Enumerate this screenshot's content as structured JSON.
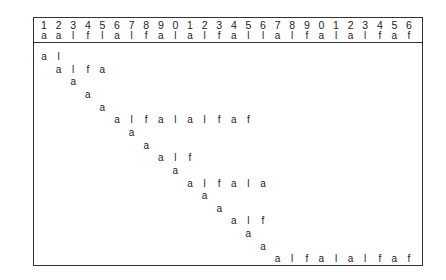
{
  "header": {
    "numbers": [
      "1",
      "2",
      "3",
      "4",
      "5",
      "6",
      "7",
      "8",
      "9",
      "0",
      "1",
      "2",
      "3",
      "4",
      "5",
      "6",
      "7",
      "8",
      "9",
      "0",
      "1",
      "2",
      "3",
      "4",
      "5",
      "6"
    ],
    "letters": [
      "a",
      "a",
      "l",
      "f",
      "l",
      "a",
      "l",
      "f",
      "a",
      "l",
      "a",
      "l",
      "f",
      "a",
      "l",
      "l",
      "a",
      "l",
      "f",
      "a",
      "l",
      "a",
      "l",
      "f",
      "a",
      "f"
    ]
  },
  "rows": [
    {
      "start": 1,
      "chars": [
        "a",
        "l"
      ]
    },
    {
      "start": 2,
      "chars": [
        "a",
        "l",
        "f",
        "a"
      ]
    },
    {
      "start": 3,
      "chars": [
        "a"
      ]
    },
    {
      "start": 4,
      "chars": [
        "a"
      ]
    },
    {
      "start": 5,
      "chars": [
        "a"
      ]
    },
    {
      "start": 6,
      "chars": [
        "a",
        "l",
        "f",
        "a",
        "l",
        "a",
        "l",
        "f",
        "a",
        "f"
      ]
    },
    {
      "start": 7,
      "chars": [
        "a"
      ]
    },
    {
      "start": 8,
      "chars": [
        "a"
      ]
    },
    {
      "start": 9,
      "chars": [
        "a",
        "l",
        "f"
      ]
    },
    {
      "start": 10,
      "chars": [
        "a"
      ]
    },
    {
      "start": 11,
      "chars": [
        "a",
        "l",
        "f",
        "a",
        "l",
        "a"
      ]
    },
    {
      "start": 12,
      "chars": [
        "a"
      ]
    },
    {
      "start": 13,
      "chars": [
        "a"
      ]
    },
    {
      "start": 14,
      "chars": [
        "a",
        "l",
        "f"
      ]
    },
    {
      "start": 15,
      "chars": [
        "a"
      ]
    },
    {
      "start": 16,
      "chars": [
        "a"
      ]
    },
    {
      "start": 17,
      "chars": [
        "a",
        "l",
        "f",
        "a",
        "l",
        "a",
        "l",
        "f",
        "a",
        "f"
      ]
    }
  ]
}
